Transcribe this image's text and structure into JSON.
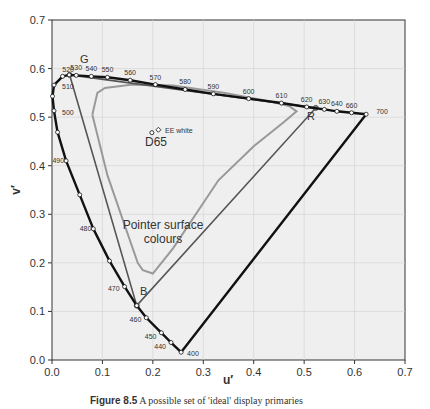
{
  "chart_data": {
    "type": "scatter",
    "title": "",
    "xlabel": "u′",
    "ylabel": "v′",
    "xlim": [
      0,
      0.7
    ],
    "ylim": [
      0,
      0.7
    ],
    "xticks": [
      "0.0",
      "0.1",
      "0.2",
      "0.3",
      "0.4",
      "0.5",
      "0.6",
      "0.7"
    ],
    "yticks": [
      "0.0",
      "0.1",
      "0.2",
      "0.3",
      "0.4",
      "0.5",
      "0.6",
      "0.7"
    ],
    "grid": true,
    "spectral_locus": {
      "name": "Spectral locus",
      "points": [
        {
          "nm": "400",
          "u": 0.256,
          "v": 0.016
        },
        {
          "nm": "440",
          "u": 0.236,
          "v": 0.036
        },
        {
          "nm": "450",
          "u": 0.217,
          "v": 0.056
        },
        {
          "nm": "460",
          "u": 0.187,
          "v": 0.087
        },
        {
          "nm": "",
          "u": 0.168,
          "v": 0.112
        },
        {
          "nm": "470",
          "u": 0.144,
          "v": 0.151
        },
        {
          "nm": "",
          "u": 0.114,
          "v": 0.204
        },
        {
          "nm": "480",
          "u": 0.082,
          "v": 0.27
        },
        {
          "nm": "",
          "u": 0.055,
          "v": 0.34
        },
        {
          "nm": "490",
          "u": 0.028,
          "v": 0.41
        },
        {
          "nm": "",
          "u": 0.011,
          "v": 0.469
        },
        {
          "nm": "500",
          "u": 0.004,
          "v": 0.513
        },
        {
          "nm": "",
          "u": 0.001,
          "v": 0.543
        },
        {
          "nm": "510",
          "u": 0.004,
          "v": 0.566
        },
        {
          "nm": "",
          "u": 0.021,
          "v": 0.584
        },
        {
          "nm": "520",
          "u": 0.034,
          "v": 0.587
        },
        {
          "nm": "530",
          "u": 0.048,
          "v": 0.586
        },
        {
          "nm": "540",
          "u": 0.078,
          "v": 0.584
        },
        {
          "nm": "550",
          "u": 0.11,
          "v": 0.582
        },
        {
          "nm": "560",
          "u": 0.155,
          "v": 0.576
        },
        {
          "nm": "570",
          "u": 0.205,
          "v": 0.567
        },
        {
          "nm": "580",
          "u": 0.264,
          "v": 0.557
        },
        {
          "nm": "590",
          "u": 0.32,
          "v": 0.548
        },
        {
          "nm": "600",
          "u": 0.39,
          "v": 0.538
        },
        {
          "nm": "610",
          "u": 0.455,
          "v": 0.529
        },
        {
          "nm": "620",
          "u": 0.505,
          "v": 0.521
        },
        {
          "nm": "630",
          "u": 0.54,
          "v": 0.516
        },
        {
          "nm": "640",
          "u": 0.565,
          "v": 0.512
        },
        {
          "nm": "660",
          "u": 0.594,
          "v": 0.509
        },
        {
          "nm": "700",
          "u": 0.623,
          "v": 0.506
        }
      ]
    },
    "primaries": {
      "name": "Display primaries triangle",
      "points": [
        {
          "label": "G",
          "u": 0.035,
          "v": 0.587
        },
        {
          "label": "R",
          "u": 0.523,
          "v": 0.519
        },
        {
          "label": "B",
          "u": 0.168,
          "v": 0.112
        }
      ]
    },
    "pointer_gamut": {
      "name": "Pointer surface colours",
      "points": [
        {
          "u": 0.08,
          "v": 0.505
        },
        {
          "u": 0.09,
          "v": 0.55
        },
        {
          "u": 0.105,
          "v": 0.56
        },
        {
          "u": 0.16,
          "v": 0.567
        },
        {
          "u": 0.24,
          "v": 0.565
        },
        {
          "u": 0.34,
          "v": 0.55
        },
        {
          "u": 0.42,
          "v": 0.535
        },
        {
          "u": 0.47,
          "v": 0.523
        },
        {
          "u": 0.485,
          "v": 0.512
        },
        {
          "u": 0.46,
          "v": 0.49
        },
        {
          "u": 0.4,
          "v": 0.44
        },
        {
          "u": 0.33,
          "v": 0.37
        },
        {
          "u": 0.24,
          "v": 0.23
        },
        {
          "u": 0.2,
          "v": 0.178
        },
        {
          "u": 0.18,
          "v": 0.185
        },
        {
          "u": 0.17,
          "v": 0.2
        },
        {
          "u": 0.15,
          "v": 0.26
        },
        {
          "u": 0.11,
          "v": 0.38
        },
        {
          "u": 0.08,
          "v": 0.505
        }
      ]
    },
    "white_points": [
      {
        "label": "D65",
        "u": 0.198,
        "v": 0.468
      },
      {
        "label": "EE white",
        "u": 0.211,
        "v": 0.474
      }
    ],
    "annotations": [
      {
        "text": "Pointer surface colours",
        "u": 0.2,
        "v": 0.3
      },
      {
        "text": "D65",
        "u": 0.19,
        "v": 0.44
      },
      {
        "text": "EE white",
        "u": 0.225,
        "v": 0.475
      }
    ]
  },
  "labels": {
    "x_axis": "u′",
    "y_axis": "v′",
    "pointer_line1": "Pointer surface",
    "pointer_line2": "colours",
    "d65": "D65",
    "ee_white": "EE white",
    "g": "G",
    "r": "R",
    "b": "B"
  },
  "caption": {
    "number": "Figure 8.5",
    "text": "A possible set of 'ideal' display primaries"
  }
}
